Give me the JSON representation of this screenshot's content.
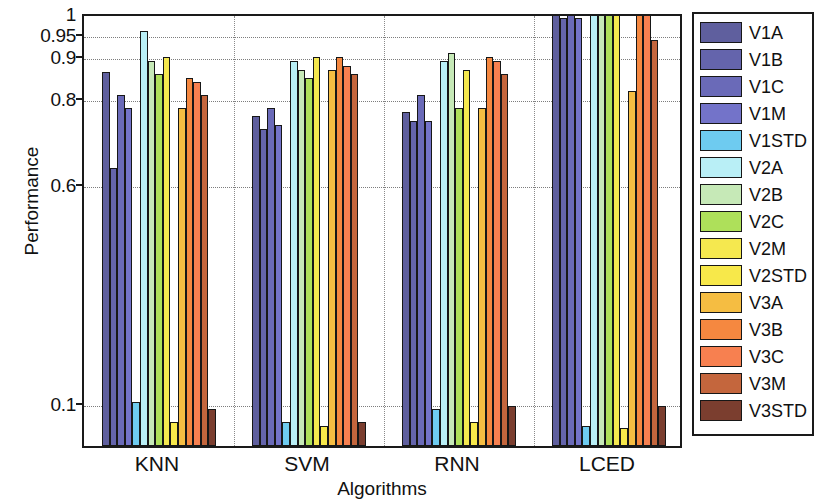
{
  "chart_data": {
    "type": "bar",
    "title": "",
    "xlabel": "Algorithms",
    "ylabel": "Performance",
    "categories": [
      "KNN",
      "SVM",
      "RNN",
      "LCED"
    ],
    "ytick_labels": [
      "1",
      "0.95",
      "0.9",
      "0.8",
      "0.6",
      "0.1"
    ],
    "ytick_values": [
      1,
      0.95,
      0.9,
      0.8,
      0.6,
      0.1
    ],
    "ylim": [
      0,
      1
    ],
    "grid": true,
    "legend_position": "right",
    "axis_scale": "custom-nonlinear",
    "series": [
      {
        "name": "V1A",
        "color": "#5f5f9e",
        "values": [
          0.86,
          0.755,
          0.765,
          0.995
        ]
      },
      {
        "name": "V1B",
        "color": "#6464ac",
        "values": [
          0.635,
          0.725,
          0.745,
          0.985
        ]
      },
      {
        "name": "V1C",
        "color": "#6a6ab8",
        "values": [
          0.805,
          0.775,
          0.805,
          0.995
        ]
      },
      {
        "name": "V1M",
        "color": "#7373c9",
        "values": [
          0.775,
          0.735,
          0.745,
          0.985
        ]
      },
      {
        "name": "V1STD",
        "color": "#6ecbf0",
        "values": [
          0.1,
          0.055,
          0.085,
          0.045
        ]
      },
      {
        "name": "V2A",
        "color": "#b9eff6",
        "values": [
          0.955,
          0.885,
          0.885,
          1.0
        ]
      },
      {
        "name": "V2B",
        "color": "#c6e9b7",
        "values": [
          0.885,
          0.865,
          0.905,
          1.0
        ]
      },
      {
        "name": "V2C",
        "color": "#aee05a",
        "values": [
          0.855,
          0.845,
          0.775,
          1.0
        ]
      },
      {
        "name": "V2M",
        "color": "#f5e84f",
        "values": [
          0.895,
          0.895,
          0.865,
          1.0
        ]
      },
      {
        "name": "V2STD",
        "color": "#f7e84a",
        "values": [
          0.055,
          0.045,
          0.055,
          0.04
        ]
      },
      {
        "name": "V3A",
        "color": "#f5bd42",
        "values": [
          0.775,
          0.865,
          0.775,
          0.815
        ]
      },
      {
        "name": "V3B",
        "color": "#f58840",
        "values": [
          0.845,
          0.895,
          0.895,
          1.0
        ]
      },
      {
        "name": "V3C",
        "color": "#f78050",
        "values": [
          0.835,
          0.875,
          0.885,
          1.0
        ]
      },
      {
        "name": "V3M",
        "color": "#c4663d",
        "values": [
          0.805,
          0.855,
          0.855,
          0.935
        ]
      },
      {
        "name": "V3STD",
        "color": "#7b3e2f",
        "values": [
          0.085,
          0.055,
          0.09,
          0.09
        ]
      }
    ]
  },
  "legend": {
    "items": [
      {
        "label": "V1A",
        "color": "#5f5f9e"
      },
      {
        "label": "V1B",
        "color": "#6464ac"
      },
      {
        "label": "V1C",
        "color": "#6a6ab8"
      },
      {
        "label": "V1M",
        "color": "#7373c9"
      },
      {
        "label": "V1STD",
        "color": "#6ecbf0"
      },
      {
        "label": "V2A",
        "color": "#b9eff6"
      },
      {
        "label": "V2B",
        "color": "#c6e9b7"
      },
      {
        "label": "V2C",
        "color": "#aee05a"
      },
      {
        "label": "V2M",
        "color": "#f5e84f"
      },
      {
        "label": "V2STD",
        "color": "#f7e84a"
      },
      {
        "label": "V3A",
        "color": "#f5bd42"
      },
      {
        "label": "V3B",
        "color": "#f58840"
      },
      {
        "label": "V3C",
        "color": "#f78050"
      },
      {
        "label": "V3M",
        "color": "#c4663d"
      },
      {
        "label": "V3STD",
        "color": "#7b3e2f"
      }
    ]
  }
}
